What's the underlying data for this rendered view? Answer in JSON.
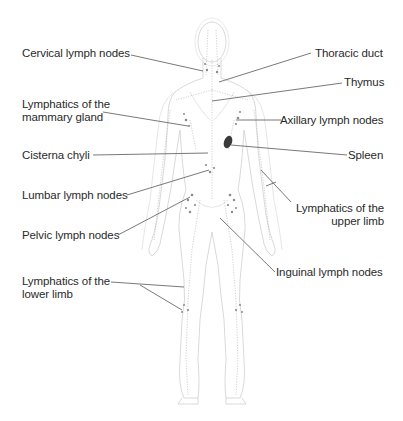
{
  "diagram": {
    "colors": {
      "background": "#ffffff",
      "label_text": "#2a2a2a",
      "leader_line": "#6a6a6a",
      "body_outline": "#c8c8c8",
      "lymph_node": "#7a7a7a",
      "spleen": "#333333"
    },
    "labels_left": [
      {
        "id": "cervical",
        "text": "Cervical lymph nodes"
      },
      {
        "id": "mammary",
        "text": "Lymphatics of the\nmammary gland"
      },
      {
        "id": "cisterna",
        "text": "Cisterna chyli"
      },
      {
        "id": "lumbar",
        "text": "Lumbar lymph nodes"
      },
      {
        "id": "pelvic",
        "text": "Pelvic lymph nodes"
      },
      {
        "id": "lower-limb",
        "text": "Lymphatics of the\nlower limb"
      }
    ],
    "labels_right": [
      {
        "id": "thoracic",
        "text": "Thoracic duct"
      },
      {
        "id": "thymus",
        "text": "Thymus"
      },
      {
        "id": "axillary",
        "text": "Axillary lymph nodes"
      },
      {
        "id": "spleen",
        "text": "Spleen"
      },
      {
        "id": "upper-limb",
        "text": "Lymphatics of the\nupper limb"
      },
      {
        "id": "inguinal",
        "text": "Inguinal lymph nodes"
      }
    ]
  }
}
